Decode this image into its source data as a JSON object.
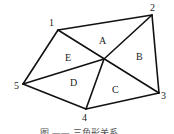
{
  "diagram": {
    "vertices": [
      {
        "id": "1",
        "x": 58,
        "y": 30,
        "lx": 49,
        "ly": 26
      },
      {
        "id": "2",
        "x": 152,
        "y": 15,
        "lx": 150,
        "ly": 11
      },
      {
        "id": "3",
        "x": 159,
        "y": 93,
        "lx": 161,
        "ly": 99
      },
      {
        "id": "4",
        "x": 86,
        "y": 109,
        "lx": 82,
        "ly": 121
      },
      {
        "id": "5",
        "x": 23,
        "y": 84,
        "lx": 14,
        "ly": 89
      }
    ],
    "center": {
      "x": 104,
      "y": 59
    },
    "regions": [
      {
        "label": "A",
        "x": 99,
        "y": 44
      },
      {
        "label": "B",
        "x": 136,
        "y": 60
      },
      {
        "label": "C",
        "x": 112,
        "y": 93
      },
      {
        "label": "D",
        "x": 70,
        "y": 86
      },
      {
        "label": "E",
        "x": 65,
        "y": 61
      }
    ],
    "caption": "图 —— 三角形关系"
  }
}
